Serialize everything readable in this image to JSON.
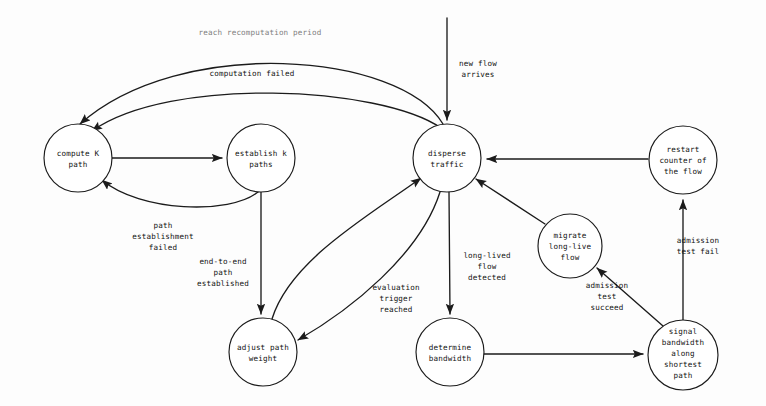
{
  "diagram": {
    "type": "state-transition-diagram",
    "background_color": "#fdfdfd",
    "stroke_color": "#1b1b1b",
    "text_color": "#111111",
    "faded_text_color": "#7d7d7d",
    "width": 766,
    "height": 406,
    "nodes": [
      {
        "id": "compute-k-path",
        "label": "compute K path",
        "lines": [
          "compute K",
          "path"
        ],
        "cx": 78,
        "cy": 158,
        "rx": 34,
        "ry": 34
      },
      {
        "id": "establish-k-paths",
        "label": "establish k paths",
        "lines": [
          "establish k",
          "paths"
        ],
        "cx": 261,
        "cy": 158,
        "rx": 34,
        "ry": 34
      },
      {
        "id": "disperse-traffic",
        "label": "disperse traffic",
        "lines": [
          "disperse",
          "traffic"
        ],
        "cx": 447,
        "cy": 158,
        "rx": 34,
        "ry": 34
      },
      {
        "id": "restart-counter-of-the-flow",
        "label": "restart counter of the flow",
        "lines": [
          "restart",
          "counter of",
          "the flow"
        ],
        "cx": 683,
        "cy": 160,
        "rx": 34,
        "ry": 34
      },
      {
        "id": "migrate-long-live-flow",
        "label": "migrate long-live flow",
        "lines": [
          "migrate",
          "long-live",
          "flow"
        ],
        "cx": 570,
        "cy": 246,
        "rx": 32,
        "ry": 32
      },
      {
        "id": "adjust-path-weight",
        "label": "adjust path weight",
        "lines": [
          "adjust path",
          "weight"
        ],
        "cx": 263,
        "cy": 352,
        "rx": 34,
        "ry": 34
      },
      {
        "id": "determine-bandwidth",
        "label": "determine bandwidth",
        "lines": [
          "determine",
          "bandwidth"
        ],
        "cx": 450,
        "cy": 352,
        "rx": 34,
        "ry": 34
      },
      {
        "id": "signal-bandwidth-along-shortest-path",
        "label": "signal bandwidth along shortest path",
        "lines": [
          "signal",
          "bandwidth",
          "along",
          "shortest",
          "path"
        ],
        "cx": 683,
        "cy": 355,
        "rx": 35,
        "ry": 35
      }
    ],
    "edges": [
      {
        "id": "edge-new-flow-arrives",
        "from": "external-entry",
        "to": "disperse-traffic",
        "label_lines": [
          "new flow",
          "arrives"
        ],
        "label_x": 478,
        "label_y": 66,
        "faded": false
      },
      {
        "id": "edge-reach-recomputation-period",
        "from": "disperse-traffic",
        "to": "compute-k-path",
        "label_lines": [
          "reach recomputation period"
        ],
        "label_x": 260,
        "label_y": 35,
        "faded": true
      },
      {
        "id": "edge-computation-failed",
        "from": "establish-k-paths",
        "to": "compute-k-path",
        "label_lines": [
          "computation failed"
        ],
        "label_x": 252,
        "label_y": 76,
        "faded": false
      },
      {
        "id": "edge-compute-to-establish",
        "from": "compute-k-path",
        "to": "establish-k-paths",
        "label_lines": [],
        "label_x": 0,
        "label_y": 0,
        "faded": false
      },
      {
        "id": "edge-path-establishment-failed",
        "from": "establish-k-paths",
        "to": "compute-k-path",
        "label_lines": [
          "path",
          "establishment",
          "failed"
        ],
        "label_x": 163,
        "label_y": 228,
        "faded": false
      },
      {
        "id": "edge-end-to-end-path-established",
        "from": "establish-k-paths",
        "to": "adjust-path-weight",
        "label_lines": [
          "end-to-end",
          "path",
          "established"
        ],
        "label_x": 225,
        "label_y": 264,
        "faded": false
      },
      {
        "id": "edge-adjust-to-disperse",
        "from": "adjust-path-weight",
        "to": "disperse-traffic",
        "label_lines": [],
        "label_x": 0,
        "label_y": 0,
        "faded": false
      },
      {
        "id": "edge-evaluation-trigger-reached",
        "from": "disperse-traffic",
        "to": "adjust-path-weight",
        "label_lines": [
          "evaluation",
          "trigger",
          "reached"
        ],
        "label_x": 396,
        "label_y": 290,
        "faded": false
      },
      {
        "id": "edge-long-lived-flow-detected",
        "from": "disperse-traffic",
        "to": "determine-bandwidth",
        "label_lines": [
          "long-lived",
          "flow",
          "detected"
        ],
        "label_x": 487,
        "label_y": 258,
        "faded": false
      },
      {
        "id": "edge-determine-to-signal",
        "from": "determine-bandwidth",
        "to": "signal-bandwidth-along-shortest-path",
        "label_lines": [],
        "label_x": 0,
        "label_y": 0,
        "faded": false
      },
      {
        "id": "edge-admission-test-succeed",
        "from": "signal-bandwidth-along-shortest-path",
        "to": "migrate-long-live-flow",
        "label_lines": [
          "admission",
          "test",
          "succeed"
        ],
        "label_x": 607,
        "label_y": 288,
        "faded": false
      },
      {
        "id": "edge-admission-test-fail",
        "from": "signal-bandwidth-along-shortest-path",
        "to": "restart-counter-of-the-flow",
        "label_lines": [
          "admission",
          "test fail"
        ],
        "label_x": 683,
        "label_y": 243,
        "faded": false
      },
      {
        "id": "edge-migrate-to-disperse",
        "from": "migrate-long-live-flow",
        "to": "disperse-traffic",
        "label_lines": [],
        "label_x": 0,
        "label_y": 0,
        "faded": false
      },
      {
        "id": "edge-restart-to-disperse",
        "from": "restart-counter-of-the-flow",
        "to": "disperse-traffic",
        "label_lines": [],
        "label_x": 0,
        "label_y": 0,
        "faded": false
      }
    ]
  }
}
